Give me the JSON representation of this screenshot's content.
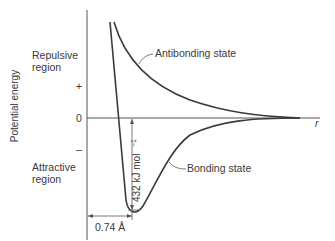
{
  "diagram": {
    "type": "potential-energy-curve",
    "y_axis_label": "Potential energy",
    "x_axis_label": "r",
    "ticks": {
      "plus": "+",
      "zero": "0",
      "minus": "–"
    },
    "regions": {
      "repulsive_line1": "Repulsive",
      "repulsive_line2": "region",
      "attractive_line1": "Attractive",
      "attractive_line2": "region"
    },
    "curves": {
      "antibonding": "Antibonding state",
      "bonding": "Bonding state"
    },
    "annotations": {
      "well_depth": "432 kJ mol",
      "well_depth_exp": "−1",
      "bond_length": "0.74 Å"
    },
    "colors": {
      "line": "#3a3a3a",
      "axis": "#555555",
      "background": "#ffffff"
    }
  }
}
